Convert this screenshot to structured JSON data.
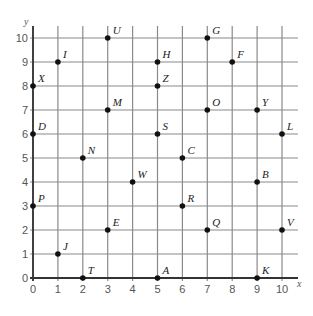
{
  "chart_data": {
    "type": "scatter",
    "title": "",
    "xlabel": "x",
    "ylabel": "y",
    "xlim": [
      0,
      10
    ],
    "ylim": [
      0,
      10
    ],
    "grid": true,
    "x_ticks": [
      "0",
      "1",
      "2",
      "3",
      "4",
      "5",
      "6",
      "7",
      "8",
      "9",
      "10"
    ],
    "y_ticks": [
      "0",
      "1",
      "2",
      "3",
      "4",
      "5",
      "6",
      "7",
      "8",
      "9",
      "10"
    ],
    "points": [
      {
        "label": "G",
        "x": 7,
        "y": 10
      },
      {
        "label": "U",
        "x": 3,
        "y": 10
      },
      {
        "label": "I",
        "x": 1,
        "y": 9
      },
      {
        "label": "H",
        "x": 5,
        "y": 9
      },
      {
        "label": "F",
        "x": 8,
        "y": 9
      },
      {
        "label": "X",
        "x": 0,
        "y": 8
      },
      {
        "label": "Z",
        "x": 5,
        "y": 8
      },
      {
        "label": "M",
        "x": 3,
        "y": 7
      },
      {
        "label": "O",
        "x": 7,
        "y": 7
      },
      {
        "label": "Y",
        "x": 9,
        "y": 7
      },
      {
        "label": "D",
        "x": 0,
        "y": 6
      },
      {
        "label": "S",
        "x": 5,
        "y": 6
      },
      {
        "label": "L",
        "x": 10,
        "y": 6
      },
      {
        "label": "N",
        "x": 2,
        "y": 5
      },
      {
        "label": "C",
        "x": 6,
        "y": 5
      },
      {
        "label": "W",
        "x": 4,
        "y": 4
      },
      {
        "label": "B",
        "x": 9,
        "y": 4
      },
      {
        "label": "P",
        "x": 0,
        "y": 3
      },
      {
        "label": "R",
        "x": 6,
        "y": 3
      },
      {
        "label": "E",
        "x": 3,
        "y": 2
      },
      {
        "label": "Q",
        "x": 7,
        "y": 2
      },
      {
        "label": "V",
        "x": 10,
        "y": 2
      },
      {
        "label": "J",
        "x": 1,
        "y": 1
      },
      {
        "label": "T",
        "x": 2,
        "y": 0
      },
      {
        "label": "A",
        "x": 5,
        "y": 0
      },
      {
        "label": "K",
        "x": 9,
        "y": 0
      }
    ]
  },
  "colors": {
    "grid": "#8a8a8a",
    "axis": "#333333",
    "point": "#111111",
    "tick_text": "#555555"
  }
}
